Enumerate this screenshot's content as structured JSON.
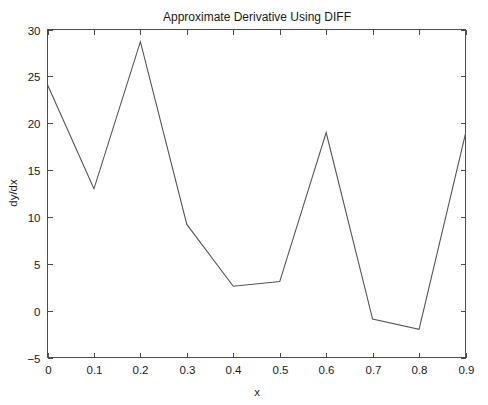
{
  "chart_data": {
    "type": "line",
    "title": "Approximate Derivative Using DIFF",
    "xlabel": "x",
    "ylabel": "dy/dx",
    "x": [
      0,
      0.1,
      0.2,
      0.3,
      0.4,
      0.5,
      0.6,
      0.7,
      0.8,
      0.9
    ],
    "values": [
      24.1,
      13.0,
      28.7,
      9.2,
      2.6,
      3.1,
      19.0,
      -0.9,
      -2.0,
      18.9
    ],
    "series": [
      {
        "name": "dy/dx",
        "values": [
          24.1,
          13.0,
          28.7,
          9.2,
          2.6,
          3.1,
          19.0,
          -0.9,
          -2.0,
          18.9
        ],
        "color": "#555555"
      }
    ],
    "xlim": [
      0,
      0.9
    ],
    "ylim": [
      -5,
      30
    ],
    "xticks": [
      0,
      0.1,
      0.2,
      0.3,
      0.4,
      0.5,
      0.6,
      0.7,
      0.8,
      0.9
    ],
    "xticklabels": [
      "0",
      "0.1",
      "0.2",
      "0.3",
      "0.4",
      "0.5",
      "0.6",
      "0.7",
      "0.8",
      "0.9"
    ],
    "yticks": [
      -5,
      0,
      5,
      10,
      15,
      20,
      25,
      30
    ],
    "yticklabels": [
      "−5",
      "0",
      "5",
      "10",
      "15",
      "20",
      "25",
      "30"
    ],
    "grid": false,
    "legend": false,
    "legend_position": "none",
    "background_color": "#ffffff",
    "axis_color": "#4d4d4d",
    "tick_direction": "out",
    "box": true
  }
}
